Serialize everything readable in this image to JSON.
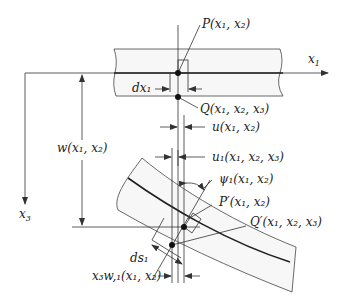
{
  "diagram": {
    "title": "",
    "labels": {
      "x1_axis": "x",
      "x1_axis_sub": "1",
      "x3_axis": "x",
      "x3_axis_sub": "3",
      "P": "P(x₁, x₂)",
      "Q": "Q(x₁, x₂, x₃)",
      "dx1": "dx₁",
      "u": "u(x₁, x₂)",
      "w": "w(x₁, x₂)",
      "u1": "u₁(x₁, x₂, x₃)",
      "psi1": "ψ₁(x₁, x₂)",
      "P_prime": "P′(x₁, x₂)",
      "Q_prime": "Q′(x₁, x₂, x₃)",
      "ds1": "ds₁",
      "x3w1": "x₃w,₁(x₁, x₂)"
    },
    "nodes": [
      {
        "id": "P",
        "desc": "point on undeformed mid-surface"
      },
      {
        "id": "Q",
        "desc": "point below P in undeformed beam"
      },
      {
        "id": "P_prime",
        "desc": "deformed position of P"
      },
      {
        "id": "Q_prime",
        "desc": "deformed position of Q"
      }
    ],
    "edges": [
      {
        "from": "P",
        "to": "P_prime",
        "desc": "displacement u, w"
      },
      {
        "from": "Q",
        "to": "Q_prime",
        "desc": "displacement u1"
      }
    ]
  }
}
